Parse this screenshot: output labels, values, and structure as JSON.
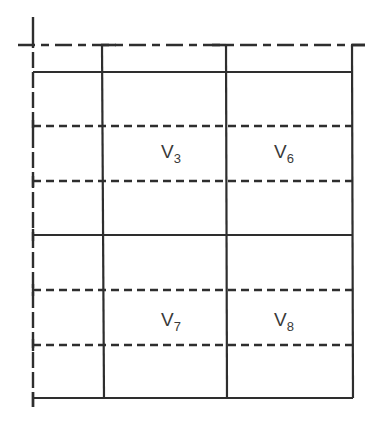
{
  "diagram": {
    "type": "grid-layout-with-dashed-subdivisions",
    "stroke_color": "#2e2e2e",
    "background": "#ffffff",
    "labels": [
      {
        "id": "v3",
        "base": "V",
        "subscript": "3"
      },
      {
        "id": "v6",
        "base": "V",
        "subscript": "6"
      },
      {
        "id": "v7",
        "base": "V",
        "subscript": "7"
      },
      {
        "id": "v8",
        "base": "V",
        "subscript": "8"
      }
    ],
    "columns": 3,
    "rows": 2,
    "dashed_subdivisions_per_row": 2
  }
}
